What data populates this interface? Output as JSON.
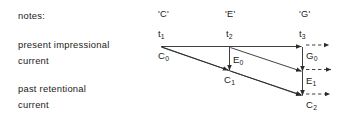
{
  "figure": {
    "row_captions": [
      {
        "id": "notes-row",
        "line1": "notes:",
        "line2": ""
      },
      {
        "id": "present-impressional-current",
        "line1": "present impressional",
        "line2": "current"
      },
      {
        "id": "past-retentional-current",
        "line1": "past retentional",
        "line2": "current"
      }
    ],
    "note_names": [
      {
        "id": "note-c",
        "label": "'C'"
      },
      {
        "id": "note-e",
        "label": "'E'"
      },
      {
        "id": "note-g",
        "label": "'G'"
      }
    ],
    "time_labels": [
      {
        "id": "t1",
        "base": "t",
        "sub": "1"
      },
      {
        "id": "t2",
        "base": "t",
        "sub": "2"
      },
      {
        "id": "t3",
        "base": "t",
        "sub": "3"
      }
    ],
    "point_labels": [
      {
        "id": "c0",
        "base": "C",
        "sub": "0"
      },
      {
        "id": "e0",
        "base": "E",
        "sub": "0"
      },
      {
        "id": "c1",
        "base": "C",
        "sub": "1"
      },
      {
        "id": "g0",
        "base": "G",
        "sub": "0"
      },
      {
        "id": "e1",
        "base": "E",
        "sub": "1"
      },
      {
        "id": "c2",
        "base": "C",
        "sub": "2"
      }
    ],
    "colors": {
      "background": "#ffffff",
      "ink": "#1a1a1a",
      "line": "#2b2b2b"
    }
  }
}
